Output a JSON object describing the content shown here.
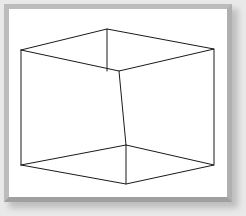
{
  "figure": {
    "shape_name": "cube",
    "projection": "oblique / one-point perspective wireframe",
    "edge_count": 12,
    "vertex_count": 8,
    "line_color": "#1a1a1a",
    "line_width": 1,
    "fill": "none"
  },
  "panel": {
    "background_color": "#ffffff",
    "frame_color": "#b0b0b0",
    "frame_highlight_color": "#bcbcbc",
    "frame_shadow_color": "#a0a0a0",
    "outer_background_color": "#e9e9e9",
    "shadow_color": "#9a9a9a"
  },
  "chart_data": {
    "type": "scatter",
    "xlabel": "",
    "ylabel": "",
    "xlim": [
      0,
      246
    ],
    "ylim": [
      216,
      0
    ],
    "grid": false,
    "legend": null,
    "vertices": [
      {
        "id": "front_top_left",
        "x": 21,
        "y": 50
      },
      {
        "id": "back_top_left",
        "x": 107,
        "y": 29
      },
      {
        "id": "back_top_right",
        "x": 214,
        "y": 49
      },
      {
        "id": "front_top_right",
        "x": 119,
        "y": 71
      },
      {
        "id": "front_bot_left",
        "x": 21,
        "y": 165
      },
      {
        "id": "back_bot_left",
        "x": 126,
        "y": 184
      },
      {
        "id": "back_bot_right",
        "x": 214,
        "y": 165
      },
      {
        "id": "front_bot_right",
        "x": 126,
        "y": 145
      }
    ],
    "edges": [
      {
        "from": "front_top_left",
        "to": "back_top_left"
      },
      {
        "from": "back_top_left",
        "to": "back_top_right"
      },
      {
        "from": "front_top_left",
        "to": "front_top_right"
      },
      {
        "from": "front_top_right",
        "to": "back_top_right"
      },
      {
        "from": "front_bot_left",
        "to": "back_bot_left"
      },
      {
        "from": "back_bot_left",
        "to": "back_bot_right"
      },
      {
        "from": "front_bot_left",
        "to": "front_bot_right"
      },
      {
        "from": "front_bot_right",
        "to": "back_bot_right"
      },
      {
        "from": "front_top_left",
        "to": "front_bot_left"
      },
      {
        "from": "back_top_left",
        "to": "front_top_right"
      },
      {
        "from": "back_top_right",
        "to": "back_bot_right"
      },
      {
        "from": "front_top_right",
        "to": "front_bot_right"
      },
      {
        "from": "front_bot_right",
        "to": "back_bot_left"
      }
    ],
    "paths": {
      "top_face": "21,50 107,29 214,49 119,71 21,50",
      "bottom_face": "21,165 126,184 214,165 126,145 21,165",
      "left_vertical": "21,50 21,165",
      "right_vertical": "214,49 214,165",
      "back_vertical": "107,29 107,71",
      "inner_vertical": "126,145 126,184",
      "center_vertical": "119,71 126,145"
    }
  }
}
